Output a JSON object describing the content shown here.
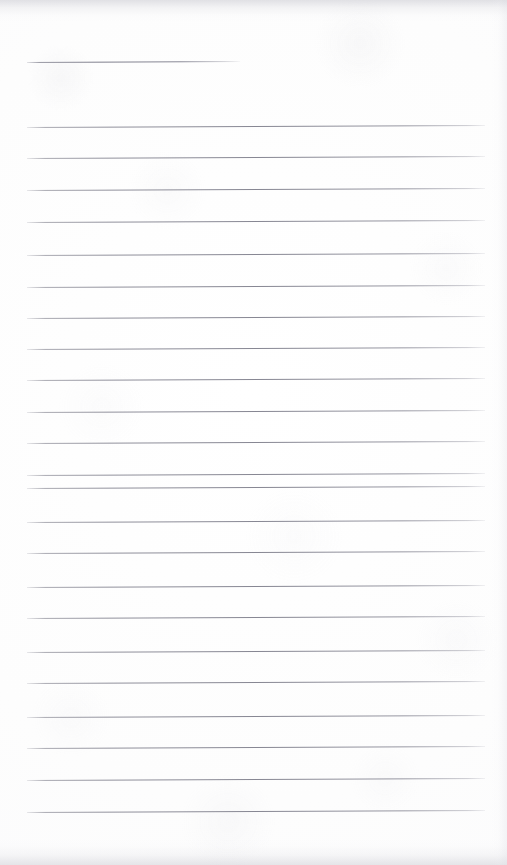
{
  "document": {
    "kind": "scanned-lined-notebook-page",
    "title": "Blank Lined Notebook Page",
    "content_text": "",
    "has_handwriting": false,
    "is_blank": true,
    "page_width": 507,
    "page_height": 865,
    "background_color": "#fdfdfd",
    "rule_color": "#86868f",
    "rule_thickness_px": 1,
    "left_margin_x": 27,
    "right_margin_x": 485,
    "line_spacing_px": 32.3,
    "total_rule_count": 24,
    "skew_degrees": -0.25,
    "edge_shadow_color": "#c4c4cc"
  },
  "rules": [
    {
      "index": 1,
      "y": 62,
      "x1": 27,
      "x2": 240,
      "length": 213,
      "variant": "short"
    },
    {
      "index": 2,
      "y": 127,
      "x1": 27,
      "x2": 485,
      "length": 458,
      "variant": "full"
    },
    {
      "index": 3,
      "y": 158,
      "x1": 27,
      "x2": 485,
      "length": 458,
      "variant": "full"
    },
    {
      "index": 4,
      "y": 190,
      "x1": 27,
      "x2": 485,
      "length": 458,
      "variant": "full"
    },
    {
      "index": 5,
      "y": 222,
      "x1": 27,
      "x2": 485,
      "length": 458,
      "variant": "full"
    },
    {
      "index": 6,
      "y": 255,
      "x1": 27,
      "x2": 485,
      "length": 458,
      "variant": "full"
    },
    {
      "index": 7,
      "y": 287,
      "x1": 27,
      "x2": 485,
      "length": 458,
      "variant": "full"
    },
    {
      "index": 8,
      "y": 318,
      "x1": 27,
      "x2": 485,
      "length": 458,
      "variant": "full"
    },
    {
      "index": 9,
      "y": 349,
      "x1": 27,
      "x2": 485,
      "length": 458,
      "variant": "full"
    },
    {
      "index": 10,
      "y": 380,
      "x1": 27,
      "x2": 485,
      "length": 458,
      "variant": "full"
    },
    {
      "index": 11,
      "y": 412,
      "x1": 27,
      "x2": 485,
      "length": 458,
      "variant": "full"
    },
    {
      "index": 12,
      "y": 443,
      "x1": 27,
      "x2": 485,
      "length": 458,
      "variant": "full"
    },
    {
      "index": 13,
      "y": 475,
      "x1": 27,
      "x2": 485,
      "length": 458,
      "variant": "full"
    },
    {
      "index": 14,
      "y": 488,
      "x1": 27,
      "x2": 485,
      "length": 458,
      "variant": "full"
    },
    {
      "index": 15,
      "y": 522,
      "x1": 27,
      "x2": 485,
      "length": 458,
      "variant": "full"
    },
    {
      "index": 16,
      "y": 553,
      "x1": 27,
      "x2": 485,
      "length": 458,
      "variant": "full"
    },
    {
      "index": 17,
      "y": 587,
      "x1": 27,
      "x2": 485,
      "length": 458,
      "variant": "full"
    },
    {
      "index": 18,
      "y": 618,
      "x1": 27,
      "x2": 485,
      "length": 458,
      "variant": "full"
    },
    {
      "index": 19,
      "y": 652,
      "x1": 27,
      "x2": 485,
      "length": 458,
      "variant": "full"
    },
    {
      "index": 20,
      "y": 683,
      "x1": 27,
      "x2": 485,
      "length": 458,
      "variant": "full"
    },
    {
      "index": 21,
      "y": 717,
      "x1": 27,
      "x2": 485,
      "length": 458,
      "variant": "full"
    },
    {
      "index": 22,
      "y": 748,
      "x1": 27,
      "x2": 485,
      "length": 458,
      "variant": "full"
    },
    {
      "index": 23,
      "y": 780,
      "x1": 27,
      "x2": 485,
      "length": 458,
      "variant": "full"
    },
    {
      "index": 24,
      "y": 812,
      "x1": 27,
      "x2": 485,
      "length": 458,
      "variant": "full"
    }
  ]
}
